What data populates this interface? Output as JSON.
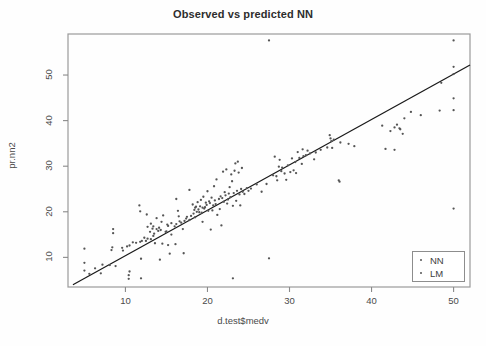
{
  "chart_data": {
    "type": "scatter",
    "title": "Observed vs predicted NN",
    "xlabel": "d.test$medv",
    "ylabel": "pr.nn2",
    "xlim": [
      3.0,
      52.0
    ],
    "ylim": [
      3.5,
      59.0
    ],
    "grid": false,
    "xticks": [
      10,
      20,
      30,
      40,
      50
    ],
    "yticks": [
      10,
      20,
      30,
      40,
      50
    ],
    "legend": {
      "position": "bottom-right",
      "entries": [
        {
          "label": "NN",
          "marker": "point",
          "color": "#555555"
        },
        {
          "label": "LM",
          "marker": "point",
          "color": "#555555"
        }
      ]
    },
    "annotations": [
      {
        "name": "identity-line",
        "type": "line",
        "x0": 3.6,
        "y0": 4.0,
        "x1": 52.0,
        "y1": 52.2,
        "color": "#1a1a1a"
      }
    ],
    "series": [
      {
        "name": "NN",
        "marker": "point",
        "color": "#555555",
        "points": [
          [
            5.0,
            11.9
          ],
          [
            5.0,
            8.8
          ],
          [
            5.0,
            7.1
          ],
          [
            5.6,
            6.4
          ],
          [
            6.3,
            7.6
          ],
          [
            7.0,
            6.5
          ],
          [
            7.2,
            8.4
          ],
          [
            8.1,
            8.3
          ],
          [
            8.3,
            11.6
          ],
          [
            8.4,
            12.2
          ],
          [
            8.5,
            16.2
          ],
          [
            8.5,
            15.3
          ],
          [
            8.8,
            8.1
          ],
          [
            9.6,
            12.1
          ],
          [
            9.7,
            11.5
          ],
          [
            10.2,
            12.4
          ],
          [
            10.4,
            5.3
          ],
          [
            10.4,
            6.1
          ],
          [
            10.5,
            6.9
          ],
          [
            10.5,
            12.6
          ],
          [
            10.9,
            13.3
          ],
          [
            11.3,
            13.2
          ],
          [
            11.7,
            21.4
          ],
          [
            11.8,
            20.1
          ],
          [
            11.8,
            13.4
          ],
          [
            11.9,
            5.4
          ],
          [
            11.9,
            9.7
          ],
          [
            12.0,
            13.6
          ],
          [
            12.3,
            14.3
          ],
          [
            12.5,
            13.6
          ],
          [
            12.6,
            19.4
          ],
          [
            12.7,
            14.1
          ],
          [
            12.7,
            16.7
          ],
          [
            13.0,
            15.6
          ],
          [
            13.1,
            14.0
          ],
          [
            13.1,
            17.4
          ],
          [
            13.3,
            16.3
          ],
          [
            13.4,
            16.8
          ],
          [
            13.4,
            14.7
          ],
          [
            13.5,
            15.2
          ],
          [
            13.6,
            13.1
          ],
          [
            13.8,
            18.6
          ],
          [
            13.8,
            16.2
          ],
          [
            14.0,
            15.8
          ],
          [
            14.1,
            16.5
          ],
          [
            14.2,
            9.5
          ],
          [
            14.3,
            16.0
          ],
          [
            14.4,
            17.8
          ],
          [
            14.5,
            13.0
          ],
          [
            14.6,
            19.2
          ],
          [
            14.9,
            15.6
          ],
          [
            15.0,
            15.7
          ],
          [
            15.1,
            17.2
          ],
          [
            15.2,
            16.9
          ],
          [
            15.2,
            12.7
          ],
          [
            15.4,
            10.8
          ],
          [
            15.6,
            17.5
          ],
          [
            15.6,
            15.0
          ],
          [
            16.0,
            16.8
          ],
          [
            16.1,
            12.9
          ],
          [
            16.2,
            22.8
          ],
          [
            16.2,
            17.3
          ],
          [
            16.4,
            20.2
          ],
          [
            16.5,
            19.0
          ],
          [
            16.6,
            17.9
          ],
          [
            16.8,
            17.6
          ],
          [
            17.0,
            16.2
          ],
          [
            17.1,
            10.9
          ],
          [
            17.2,
            18.0
          ],
          [
            17.4,
            18.5
          ],
          [
            17.5,
            18.9
          ],
          [
            17.8,
            24.8
          ],
          [
            17.8,
            18.2
          ],
          [
            18.0,
            19.1
          ],
          [
            18.2,
            21.6
          ],
          [
            18.3,
            19.6
          ],
          [
            18.4,
            20.4
          ],
          [
            18.5,
            20.9
          ],
          [
            18.5,
            18.8
          ],
          [
            18.6,
            21.1
          ],
          [
            18.7,
            20.0
          ],
          [
            18.8,
            22.1
          ],
          [
            18.9,
            20.5
          ],
          [
            19.0,
            19.9
          ],
          [
            19.1,
            21.2
          ],
          [
            19.2,
            22.6
          ],
          [
            19.3,
            19.8
          ],
          [
            19.4,
            20.9
          ],
          [
            19.4,
            17.8
          ],
          [
            19.5,
            23.3
          ],
          [
            19.6,
            20.7
          ],
          [
            19.7,
            21.0
          ],
          [
            19.8,
            22.0
          ],
          [
            19.9,
            21.5
          ],
          [
            20.0,
            24.5
          ],
          [
            20.1,
            20.2
          ],
          [
            20.2,
            22.3
          ],
          [
            20.3,
            21.9
          ],
          [
            20.4,
            16.1
          ],
          [
            20.5,
            23.1
          ],
          [
            20.6,
            20.3
          ],
          [
            20.7,
            21.4
          ],
          [
            20.8,
            25.6
          ],
          [
            20.9,
            22.5
          ],
          [
            21.0,
            21.7
          ],
          [
            21.1,
            27.1
          ],
          [
            21.2,
            19.3
          ],
          [
            21.4,
            22.8
          ],
          [
            21.5,
            20.6
          ],
          [
            21.6,
            23.4
          ],
          [
            21.7,
            17.0
          ],
          [
            21.8,
            23.0
          ],
          [
            21.9,
            28.8
          ],
          [
            22.0,
            22.2
          ],
          [
            22.1,
            24.3
          ],
          [
            22.2,
            23.6
          ],
          [
            22.3,
            29.3
          ],
          [
            22.4,
            21.8
          ],
          [
            22.5,
            22.7
          ],
          [
            22.6,
            24.0
          ],
          [
            22.7,
            25.4
          ],
          [
            22.8,
            23.2
          ],
          [
            22.9,
            28.2
          ],
          [
            23.0,
            26.7
          ],
          [
            23.1,
            21.3
          ],
          [
            23.1,
            5.4
          ],
          [
            23.2,
            24.1
          ],
          [
            23.3,
            29.0
          ],
          [
            23.4,
            30.6
          ],
          [
            23.5,
            22.4
          ],
          [
            23.6,
            24.6
          ],
          [
            23.7,
            31.0
          ],
          [
            23.8,
            28.6
          ],
          [
            23.9,
            23.8
          ],
          [
            24.0,
            21.4
          ],
          [
            24.1,
            25.0
          ],
          [
            24.2,
            29.6
          ],
          [
            24.3,
            24.4
          ],
          [
            24.5,
            23.9
          ],
          [
            24.8,
            25.2
          ],
          [
            25.0,
            24.6
          ],
          [
            25.3,
            25.1
          ],
          [
            26.0,
            26.0
          ],
          [
            26.6,
            24.4
          ],
          [
            27.2,
            26.1
          ],
          [
            27.5,
            57.6
          ],
          [
            27.5,
            9.8
          ],
          [
            28.0,
            28.0
          ],
          [
            28.2,
            32.1
          ],
          [
            28.4,
            27.8
          ],
          [
            28.5,
            26.9
          ],
          [
            28.7,
            29.9
          ],
          [
            28.8,
            31.4
          ],
          [
            29.0,
            28.9
          ],
          [
            29.1,
            29.7
          ],
          [
            29.4,
            28.4
          ],
          [
            29.6,
            27.0
          ],
          [
            29.8,
            30.2
          ],
          [
            30.1,
            28.7
          ],
          [
            30.3,
            31.7
          ],
          [
            30.5,
            29.1
          ],
          [
            30.7,
            30.9
          ],
          [
            30.8,
            28.5
          ],
          [
            31.0,
            33.1
          ],
          [
            31.2,
            31.8
          ],
          [
            31.5,
            30.5
          ],
          [
            31.6,
            33.7
          ],
          [
            31.7,
            32.2
          ],
          [
            32.0,
            32.4
          ],
          [
            32.2,
            33.4
          ],
          [
            32.5,
            32.8
          ],
          [
            33.0,
            31.5
          ],
          [
            33.2,
            33.0
          ],
          [
            33.8,
            33.6
          ],
          [
            34.6,
            34.1
          ],
          [
            34.9,
            36.8
          ],
          [
            35.0,
            36.1
          ],
          [
            35.1,
            35.5
          ],
          [
            35.2,
            34.0
          ],
          [
            35.4,
            35.8
          ],
          [
            36.0,
            26.9
          ],
          [
            36.1,
            26.6
          ],
          [
            36.2,
            35.2
          ],
          [
            37.2,
            34.9
          ],
          [
            37.9,
            34.4
          ],
          [
            41.3,
            38.9
          ],
          [
            41.7,
            33.8
          ],
          [
            42.3,
            37.7
          ],
          [
            42.8,
            38.5
          ],
          [
            42.8,
            33.6
          ],
          [
            43.1,
            39.1
          ],
          [
            43.4,
            38.3
          ],
          [
            43.5,
            38.1
          ],
          [
            43.8,
            37.1
          ],
          [
            44.0,
            40.5
          ],
          [
            44.8,
            41.9
          ],
          [
            46.0,
            41.2
          ],
          [
            48.3,
            42.2
          ],
          [
            48.5,
            48.3
          ],
          [
            50.0,
            57.6
          ],
          [
            50.0,
            51.8
          ],
          [
            50.0,
            50.2
          ],
          [
            50.0,
            44.9
          ],
          [
            50.0,
            42.3
          ],
          [
            50.0,
            20.7
          ]
        ]
      }
    ]
  },
  "chart": {
    "title": "Observed vs predicted NN",
    "xlabel": "d.test$medv",
    "ylabel": "pr.nn2"
  },
  "legend": {
    "items": [
      {
        "label": "NN"
      },
      {
        "label": "LM"
      }
    ]
  },
  "axes": {
    "x_tick_labels": [
      "10",
      "20",
      "30",
      "40",
      "50"
    ],
    "y_tick_labels": [
      "10",
      "20",
      "30",
      "40",
      "50"
    ]
  }
}
